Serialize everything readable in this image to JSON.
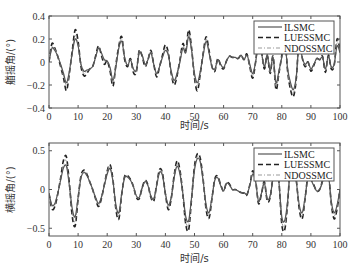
{
  "chart_data": [
    {
      "type": "line",
      "title": "",
      "xlabel": "时间/s",
      "ylabel": "艏摇角/(°)",
      "xlim": [
        0,
        100
      ],
      "ylim": [
        -0.4,
        0.4
      ],
      "xticks": [
        0,
        10,
        20,
        30,
        40,
        50,
        60,
        70,
        80,
        90,
        100
      ],
      "yticks": [
        -0.4,
        -0.2,
        0,
        0.2,
        0.4
      ],
      "ytick_labels": [
        "−0.4",
        "−0.2",
        "0",
        "0.2",
        "0.4"
      ],
      "grid": false,
      "legend_position": "upper right",
      "x": [
        0,
        1,
        2,
        3,
        4,
        5,
        6,
        7,
        8,
        9,
        10,
        11,
        12,
        13,
        14,
        15,
        16,
        17,
        18,
        19,
        20,
        21,
        22,
        23,
        24,
        25,
        26,
        27,
        28,
        29,
        30,
        31,
        32,
        33,
        34,
        35,
        36,
        37,
        38,
        39,
        40,
        41,
        42,
        43,
        44,
        45,
        46,
        47,
        48,
        49,
        50,
        51,
        52,
        53,
        54,
        55,
        56,
        57,
        58,
        59,
        60,
        61,
        62,
        63,
        64,
        65,
        66,
        67,
        68,
        69,
        70,
        71,
        72,
        73,
        74,
        75,
        76,
        77,
        78,
        79,
        80,
        81,
        82,
        83,
        84,
        85,
        86,
        87,
        88,
        89,
        90,
        91,
        92,
        93,
        94,
        95,
        96,
        97,
        98,
        99,
        100
      ],
      "series": [
        {
          "name": "ILSMC",
          "style": "solid",
          "values": [
            0.0,
            0.12,
            0.1,
            0.05,
            -0.02,
            -0.1,
            -0.18,
            -0.08,
            0.08,
            0.2,
            0.14,
            -0.02,
            -0.08,
            -0.07,
            -0.06,
            -0.04,
            0.04,
            0.12,
            0.08,
            0.02,
            0.01,
            -0.05,
            -0.16,
            -0.04,
            0.12,
            0.18,
            0.04,
            -0.03,
            0.02,
            -0.06,
            -0.07,
            0.08,
            0.06,
            -0.02,
            0.02,
            0.08,
            -0.02,
            -0.1,
            -0.04,
            0.04,
            0.1,
            0.06,
            -0.08,
            -0.16,
            -0.1,
            0.0,
            0.12,
            0.08,
            0.22,
            0.1,
            -0.1,
            -0.18,
            -0.08,
            0.06,
            0.18,
            0.08,
            -0.04,
            -0.06,
            0.02,
            -0.02,
            -0.05,
            0.01,
            0.05,
            0.04,
            0.04,
            0.03,
            0.06,
            0.02,
            0.06,
            -0.02,
            -0.1,
            0.0,
            0.16,
            0.08,
            -0.04,
            0.06,
            -0.08,
            0.04,
            -0.18,
            -0.08,
            0.04,
            0.18,
            -0.06,
            -0.18,
            -0.24,
            -0.12,
            0.18,
            0.04,
            -0.02,
            0.0,
            -0.06,
            -0.02,
            0.03,
            0.02,
            0.04,
            -0.06,
            0.05,
            -0.04,
            -0.02,
            0.14,
            0.08
          ]
        },
        {
          "name": "LUESSMC",
          "style": "dashed",
          "values": [
            0.0,
            0.16,
            0.12,
            0.05,
            -0.04,
            -0.14,
            -0.25,
            -0.1,
            0.1,
            0.28,
            0.18,
            -0.04,
            -0.12,
            -0.1,
            -0.06,
            -0.04,
            0.05,
            0.14,
            0.06,
            -0.02,
            0.01,
            -0.08,
            -0.21,
            -0.02,
            0.14,
            0.22,
            0.02,
            -0.04,
            0.03,
            -0.09,
            -0.09,
            0.1,
            0.05,
            -0.04,
            0.02,
            0.1,
            -0.02,
            -0.13,
            -0.04,
            0.06,
            0.15,
            0.08,
            -0.1,
            -0.2,
            -0.12,
            0.02,
            0.16,
            0.1,
            0.28,
            0.12,
            -0.14,
            -0.25,
            -0.1,
            0.08,
            0.22,
            0.1,
            -0.04,
            -0.08,
            0.03,
            -0.03,
            -0.06,
            0.01,
            0.05,
            0.04,
            0.04,
            0.03,
            0.06,
            0.02,
            0.07,
            -0.04,
            -0.14,
            0.0,
            0.2,
            0.1,
            -0.06,
            0.06,
            -0.1,
            0.05,
            -0.24,
            -0.1,
            0.06,
            0.24,
            -0.08,
            -0.24,
            -0.3,
            -0.14,
            0.22,
            0.04,
            -0.04,
            0.0,
            -0.08,
            -0.03,
            0.03,
            0.02,
            0.05,
            -0.09,
            0.06,
            -0.06,
            -0.03,
            0.2,
            0.1
          ]
        },
        {
          "name": "NDOSSMC",
          "style": "dash-dot",
          "values": [
            0.0,
            0.13,
            0.11,
            0.05,
            -0.03,
            -0.12,
            -0.2,
            -0.09,
            0.09,
            0.23,
            0.15,
            -0.03,
            -0.1,
            -0.08,
            -0.06,
            -0.04,
            0.04,
            0.13,
            0.07,
            0.01,
            0.01,
            -0.06,
            -0.18,
            -0.03,
            0.13,
            0.2,
            0.03,
            -0.03,
            0.02,
            -0.07,
            -0.08,
            0.09,
            0.06,
            -0.03,
            0.02,
            0.09,
            -0.02,
            -0.11,
            -0.04,
            0.05,
            0.12,
            0.07,
            -0.09,
            -0.18,
            -0.11,
            0.01,
            0.14,
            0.09,
            0.25,
            0.11,
            -0.12,
            -0.21,
            -0.09,
            0.07,
            0.2,
            0.09,
            -0.04,
            -0.07,
            0.02,
            -0.02,
            -0.05,
            0.01,
            0.05,
            0.04,
            0.04,
            0.03,
            0.06,
            0.02,
            0.06,
            -0.03,
            -0.12,
            0.0,
            0.18,
            0.09,
            -0.05,
            0.06,
            -0.09,
            0.04,
            -0.21,
            -0.09,
            0.05,
            0.21,
            -0.07,
            -0.21,
            -0.27,
            -0.13,
            0.2,
            0.04,
            -0.03,
            0.0,
            -0.07,
            -0.02,
            0.03,
            0.02,
            0.04,
            -0.07,
            0.05,
            -0.05,
            -0.02,
            0.17,
            0.09
          ]
        }
      ]
    },
    {
      "type": "line",
      "title": "",
      "xlabel": "时间/s",
      "ylabel": "横摇角/(°)",
      "xlim": [
        0,
        100
      ],
      "ylim": [
        -0.6,
        0.6
      ],
      "xticks": [
        0,
        10,
        20,
        30,
        40,
        50,
        60,
        70,
        80,
        90,
        100
      ],
      "yticks": [
        -0.5,
        0,
        0.5
      ],
      "ytick_labels": [
        "−0.5",
        "0",
        "0.5"
      ],
      "grid": false,
      "legend_position": "upper right",
      "x": [
        0,
        1,
        2,
        3,
        4,
        5,
        6,
        7,
        8,
        9,
        10,
        11,
        12,
        13,
        14,
        15,
        16,
        17,
        18,
        19,
        20,
        21,
        22,
        23,
        24,
        25,
        26,
        27,
        28,
        29,
        30,
        31,
        32,
        33,
        34,
        35,
        36,
        37,
        38,
        39,
        40,
        41,
        42,
        43,
        44,
        45,
        46,
        47,
        48,
        49,
        50,
        51,
        52,
        53,
        54,
        55,
        56,
        57,
        58,
        59,
        60,
        61,
        62,
        63,
        64,
        65,
        66,
        67,
        68,
        69,
        70,
        71,
        72,
        73,
        74,
        75,
        76,
        77,
        78,
        79,
        80,
        81,
        82,
        83,
        84,
        85,
        86,
        87,
        88,
        89,
        90,
        91,
        92,
        93,
        94,
        95,
        96,
        97,
        98,
        99,
        100
      ],
      "series": [
        {
          "name": "ILSMC",
          "style": "solid",
          "values": [
            -0.05,
            -0.2,
            -0.18,
            -0.05,
            0.12,
            0.28,
            0.3,
            0.05,
            -0.25,
            -0.35,
            -0.1,
            0.15,
            0.22,
            0.18,
            0.1,
            0.0,
            -0.1,
            -0.18,
            -0.1,
            0.05,
            0.2,
            0.27,
            0.1,
            -0.2,
            -0.3,
            -0.05,
            0.15,
            0.16,
            0.12,
            0.04,
            -0.08,
            -0.1,
            0.02,
            0.1,
            0.05,
            -0.08,
            -0.12,
            0.05,
            0.22,
            0.18,
            -0.05,
            -0.2,
            -0.1,
            0.15,
            0.3,
            0.2,
            -0.05,
            -0.35,
            -0.4,
            -0.1,
            0.25,
            0.4,
            0.35,
            0.1,
            -0.2,
            -0.3,
            -0.1,
            0.12,
            0.15,
            0.05,
            -0.02,
            0.08,
            0.06,
            0.0,
            0.0,
            -0.02,
            -0.04,
            -0.04,
            -0.06,
            0.05,
            0.2,
            0.1,
            -0.15,
            -0.05,
            0.08,
            -0.12,
            -0.08,
            0.15,
            0.4,
            0.1,
            -0.35,
            -0.4,
            -0.15,
            0.3,
            0.38,
            0.1,
            -0.2,
            -0.3,
            -0.1,
            0.15,
            0.12,
            0.05,
            -0.02,
            0.0,
            0.1,
            0.25,
            0.2,
            -0.15,
            -0.3,
            -0.2,
            0.0
          ]
        },
        {
          "name": "LUESSMC",
          "style": "dashed",
          "values": [
            -0.05,
            -0.25,
            -0.22,
            -0.06,
            0.15,
            0.38,
            0.42,
            0.08,
            -0.35,
            -0.47,
            -0.12,
            0.18,
            0.25,
            0.2,
            0.1,
            0.0,
            -0.12,
            -0.22,
            -0.12,
            0.06,
            0.24,
            0.32,
            0.12,
            -0.26,
            -0.38,
            -0.06,
            0.17,
            0.18,
            0.13,
            0.04,
            -0.1,
            -0.12,
            0.02,
            0.12,
            0.06,
            -0.1,
            -0.15,
            0.06,
            0.26,
            0.21,
            -0.06,
            -0.26,
            -0.12,
            0.18,
            0.37,
            0.25,
            -0.06,
            -0.45,
            -0.52,
            -0.12,
            0.3,
            0.46,
            0.4,
            0.12,
            -0.26,
            -0.37,
            -0.12,
            0.14,
            0.17,
            0.06,
            -0.02,
            0.09,
            0.07,
            0.0,
            0.0,
            -0.02,
            -0.04,
            -0.05,
            -0.07,
            0.06,
            0.24,
            0.12,
            -0.18,
            -0.06,
            0.1,
            -0.15,
            -0.1,
            0.18,
            0.45,
            0.12,
            -0.45,
            -0.52,
            -0.18,
            0.36,
            0.44,
            0.12,
            -0.25,
            -0.38,
            -0.12,
            0.18,
            0.14,
            0.06,
            -0.02,
            0.0,
            0.12,
            0.3,
            0.24,
            -0.18,
            -0.38,
            -0.25,
            0.0
          ]
        },
        {
          "name": "NDOSSMC",
          "style": "dash-dot",
          "values": [
            -0.05,
            -0.22,
            -0.2,
            -0.05,
            0.13,
            0.33,
            0.36,
            0.06,
            -0.3,
            -0.41,
            -0.11,
            0.16,
            0.23,
            0.19,
            0.1,
            0.0,
            -0.11,
            -0.2,
            -0.11,
            0.05,
            0.22,
            0.3,
            0.11,
            -0.23,
            -0.34,
            -0.05,
            0.16,
            0.17,
            0.12,
            0.04,
            -0.09,
            -0.11,
            0.02,
            0.11,
            0.05,
            -0.09,
            -0.13,
            0.05,
            0.24,
            0.2,
            -0.05,
            -0.23,
            -0.11,
            0.16,
            0.33,
            0.22,
            -0.05,
            -0.4,
            -0.46,
            -0.11,
            0.27,
            0.43,
            0.37,
            0.11,
            -0.23,
            -0.33,
            -0.11,
            0.13,
            0.16,
            0.05,
            -0.02,
            0.08,
            0.06,
            0.0,
            0.0,
            -0.02,
            -0.04,
            -0.04,
            -0.06,
            0.05,
            0.22,
            0.11,
            -0.16,
            -0.05,
            0.09,
            -0.13,
            -0.09,
            0.16,
            0.42,
            0.11,
            -0.4,
            -0.46,
            -0.16,
            0.33,
            0.41,
            0.11,
            -0.22,
            -0.34,
            -0.11,
            0.16,
            0.13,
            0.05,
            -0.02,
            0.0,
            0.11,
            0.27,
            0.22,
            -0.16,
            -0.34,
            -0.22,
            0.0
          ]
        }
      ]
    }
  ],
  "legend": {
    "items": [
      {
        "label": "ILSMC",
        "style": "solid"
      },
      {
        "label": "LUESSMC",
        "style": "dashed"
      },
      {
        "label": "NDOSSMC",
        "style": "dash-dot"
      }
    ]
  },
  "colors": {
    "ILSMC": "#555555",
    "LUESSMC": "#222222",
    "NDOSSMC": "#999999",
    "axes": "#555555"
  }
}
